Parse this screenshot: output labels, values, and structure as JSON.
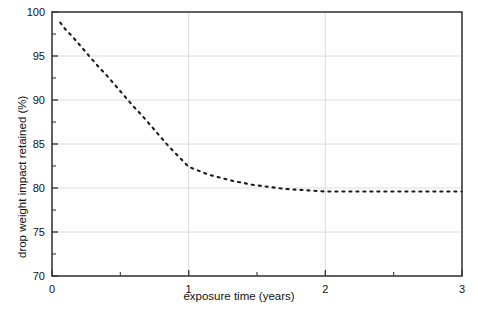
{
  "figure": {
    "clipped_title_fragment": "",
    "background_color": "#ffffff",
    "frame_color": "#3a3a3a",
    "grid_color": "#d8d8d8",
    "series_color": "#1a1a1a"
  },
  "chart_data": {
    "type": "line",
    "title": "",
    "xlabel": "exposure time (years)",
    "ylabel": "drop weight impact retained (%)",
    "xlim": [
      0,
      3
    ],
    "ylim": [
      70,
      100
    ],
    "xticks": [
      0,
      1,
      2,
      3
    ],
    "xtick_labels": [
      "0",
      "1",
      "2",
      "3"
    ],
    "xminor_ticks": [
      0.5,
      1.5,
      2.5
    ],
    "yticks": [
      70,
      75,
      80,
      85,
      90,
      95,
      100
    ],
    "ytick_labels": [
      "70",
      "75",
      "80",
      "85",
      "90",
      "95",
      "100"
    ],
    "yminor_ticks": [
      72.5,
      77.5,
      82.5,
      87.5,
      92.5,
      97.5
    ],
    "grid": true,
    "grid_axis": "both",
    "legend": false,
    "legend_position": "none",
    "linestyle": "dotted",
    "marker": "none",
    "series": [
      {
        "name": "drop weight impact retained",
        "x": [
          0.06,
          0.1,
          0.15,
          0.2,
          0.25,
          0.3,
          0.35,
          0.4,
          0.45,
          0.5,
          0.55,
          0.6,
          0.65,
          0.7,
          0.75,
          0.8,
          0.85,
          0.9,
          0.95,
          1.0,
          1.05,
          1.1,
          1.15,
          1.2,
          1.25,
          1.3,
          1.35,
          1.4,
          1.45,
          1.5,
          1.55,
          1.6,
          1.65,
          1.7,
          1.75,
          1.8,
          1.85,
          1.9,
          1.95,
          2.0,
          2.1,
          2.2,
          2.3,
          2.4,
          2.5,
          2.6,
          2.7,
          2.8,
          2.9,
          3.0
        ],
        "y": [
          98.8,
          98.0,
          97.2,
          96.3,
          95.4,
          94.5,
          93.6,
          92.8,
          91.9,
          91.0,
          90.1,
          89.2,
          88.4,
          87.5,
          86.6,
          85.7,
          84.8,
          84.0,
          83.2,
          82.4,
          82.1,
          81.8,
          81.5,
          81.3,
          81.1,
          80.9,
          80.7,
          80.6,
          80.4,
          80.3,
          80.2,
          80.1,
          80.0,
          79.9,
          79.85,
          79.8,
          79.75,
          79.7,
          79.65,
          79.6,
          79.6,
          79.6,
          79.6,
          79.6,
          79.6,
          79.6,
          79.6,
          79.6,
          79.6,
          79.6
        ],
        "color": "#1a1a1a",
        "linestyle": "dotted"
      }
    ],
    "annotations": [],
    "key_points": {
      "start": {
        "x": 0.06,
        "y": 98.8
      },
      "knee": {
        "x": 1.0,
        "y": 82.4
      },
      "plateau_start": {
        "x": 2.0,
        "y": 79.6
      },
      "end": {
        "x": 3.0,
        "y": 79.6
      }
    }
  }
}
